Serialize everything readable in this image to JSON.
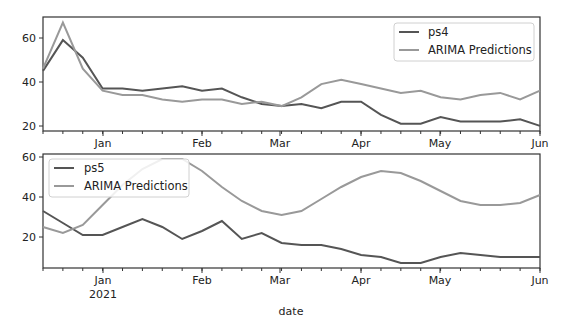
{
  "chart_data": [
    {
      "type": "line",
      "panel": "top",
      "title": "",
      "xlabel": "",
      "ylabel": "",
      "ylim": [
        17.7,
        69.5
      ],
      "yticks": [
        20,
        40,
        60
      ],
      "xtick_labels": [
        "Jan",
        "Feb",
        "Mar",
        "Apr",
        "May",
        "Jun"
      ],
      "legend_position": "upper right",
      "grid": false,
      "x_index": [
        0,
        1,
        2,
        3,
        4,
        5,
        6,
        7,
        8,
        9,
        10,
        11,
        12,
        13,
        14,
        15,
        16,
        17,
        18,
        19,
        20,
        21,
        22,
        23,
        24,
        25
      ],
      "series": [
        {
          "name": "ps4",
          "color": "#555555",
          "values": [
            45,
            59,
            51,
            37,
            37,
            36,
            37,
            38,
            36,
            37,
            33,
            30,
            29,
            30,
            28,
            31,
            31,
            25,
            21,
            21,
            24,
            22,
            22,
            22,
            23,
            20
          ]
        },
        {
          "name": "ARIMA Predictions",
          "color": "#999999",
          "values": [
            46,
            67,
            46,
            36,
            34,
            34,
            32,
            31,
            32,
            32,
            30,
            31,
            29,
            33,
            39,
            41,
            39,
            37,
            35,
            36,
            33,
            32,
            34,
            35,
            32,
            36
          ]
        }
      ]
    },
    {
      "type": "line",
      "panel": "bottom",
      "title": "",
      "xlabel": "date",
      "ylabel": "",
      "ylim": [
        4.5,
        61.5
      ],
      "yticks": [
        20,
        40,
        60
      ],
      "xtick_labels": [
        "Jan\n2021",
        "Feb",
        "Mar",
        "Apr",
        "May",
        "Jun"
      ],
      "legend_position": "upper left",
      "grid": false,
      "x_index": [
        0,
        1,
        2,
        3,
        4,
        5,
        6,
        7,
        8,
        9,
        10,
        11,
        12,
        13,
        14,
        15,
        16,
        17,
        18,
        19,
        20,
        21,
        22,
        23,
        24,
        25
      ],
      "series": [
        {
          "name": "ps5",
          "color": "#555555",
          "values": [
            33,
            27,
            21,
            21,
            25,
            29,
            25,
            19,
            23,
            28,
            19,
            22,
            17,
            16,
            16,
            14,
            11,
            10,
            7,
            7,
            10,
            12,
            11,
            10,
            10,
            10
          ]
        },
        {
          "name": "ARIMA Predictions",
          "color": "#999999",
          "values": [
            25,
            22,
            26,
            36,
            46,
            54,
            59,
            59,
            53,
            45,
            38,
            33,
            31,
            33,
            39,
            45,
            50,
            53,
            52,
            48,
            43,
            38,
            36,
            36,
            37,
            41
          ]
        }
      ]
    }
  ],
  "top": {
    "yticks": [
      "60",
      "40",
      "20"
    ],
    "xticks": [
      "Jan",
      "Feb",
      "Mar",
      "Apr",
      "May",
      "Jun"
    ],
    "legend": [
      "ps4",
      "ARIMA Predictions"
    ]
  },
  "bottom": {
    "yticks": [
      "60",
      "40",
      "20"
    ],
    "xticks": [
      "Jan",
      "Feb",
      "Mar",
      "Apr",
      "May",
      "Jun"
    ],
    "year_label": "2021",
    "legend": [
      "ps5",
      "ARIMA Predictions"
    ],
    "xlabel": "date"
  }
}
